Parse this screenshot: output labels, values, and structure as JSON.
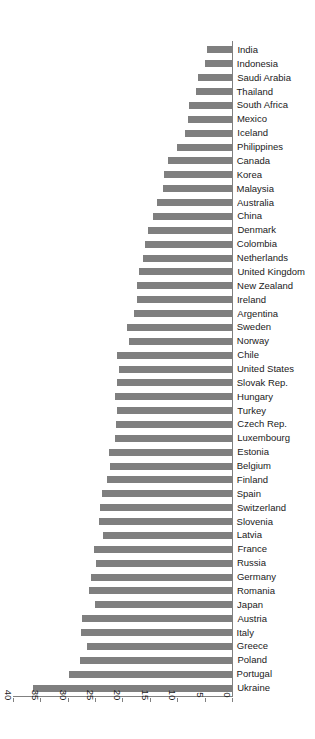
{
  "chart_data": {
    "type": "bar",
    "orientation": "horizontal",
    "title": "",
    "xlabel": "",
    "ylabel": "",
    "xlim": [
      0,
      40
    ],
    "xticks": [
      0,
      5,
      10,
      15,
      20,
      25,
      30,
      35,
      40
    ],
    "grid": false,
    "legend": null,
    "bar_color": "#7f7f7f",
    "axis_color": "#808080",
    "rotated_180": true,
    "categories": [
      "Ukraine",
      "Portugal",
      "Poland",
      "Greece",
      "Italy",
      "Austria",
      "Japan",
      "Romania",
      "Germany",
      "Russia",
      "France",
      "Latvia",
      "Slovenia",
      "Switzerland",
      "Spain",
      "Finland",
      "Belgium",
      "Estonia",
      "Luxembourg",
      "Czech Rep.",
      "Turkey",
      "Hungary",
      "Slovak Rep.",
      "United States",
      "Chile",
      "Norway",
      "Sweden",
      "Argentina",
      "Ireland",
      "New Zealand",
      "United Kingdom",
      "Netherlands",
      "Colombia",
      "Denmark",
      "China",
      "Australia",
      "Malaysia",
      "Korea",
      "Canada",
      "Philippines",
      "Iceland",
      "Mexico",
      "South Africa",
      "Thailand",
      "Saudi Arabia",
      "Indonesia",
      "India"
    ],
    "values": [
      36.5,
      30.0,
      28.0,
      26.7,
      27.8,
      27.5,
      25.2,
      26.3,
      26.0,
      25.0,
      25.3,
      23.8,
      24.5,
      24.3,
      23.9,
      23.0,
      22.4,
      22.6,
      21.6,
      21.3,
      21.2,
      21.6,
      21.2,
      20.8,
      21.2,
      19.0,
      19.4,
      18.0,
      17.6,
      17.5,
      17.2,
      16.5,
      16.0,
      15.5,
      14.6,
      13.8,
      12.7,
      12.6,
      11.8,
      10.3,
      8.8,
      8.2,
      8.0,
      6.7,
      6.4,
      5.2,
      4.8
    ]
  }
}
